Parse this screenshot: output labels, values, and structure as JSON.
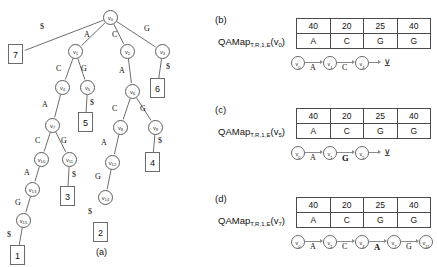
{
  "figure": {
    "caption_a": "(a)",
    "panel_b_label": "(b)",
    "panel_c_label": "(c)",
    "panel_d_label": "(d)"
  },
  "tree": {
    "nodes": [
      {
        "id": "v0",
        "label": "v",
        "sub": "0",
        "x": 103,
        "y": 10
      },
      {
        "id": "v1",
        "label": "v",
        "sub": "1",
        "x": 68,
        "y": 44
      },
      {
        "id": "v2",
        "label": "v",
        "sub": "2",
        "x": 120,
        "y": 44
      },
      {
        "id": "v3",
        "label": "v",
        "sub": "3",
        "x": 155,
        "y": 44
      },
      {
        "id": "v4",
        "label": "v",
        "sub": "4",
        "x": 55,
        "y": 80
      },
      {
        "id": "v5",
        "label": "v",
        "sub": "5",
        "x": 80,
        "y": 80
      },
      {
        "id": "v6",
        "label": "v",
        "sub": "6",
        "x": 125,
        "y": 84
      },
      {
        "id": "v7",
        "label": "v",
        "sub": "7",
        "x": 45,
        "y": 118
      },
      {
        "id": "v8",
        "label": "v",
        "sub": "8",
        "x": 113,
        "y": 120
      },
      {
        "id": "v9",
        "label": "v",
        "sub": "9",
        "x": 148,
        "y": 120
      },
      {
        "id": "v10",
        "label": "v",
        "sub": "10",
        "x": 34,
        "y": 152
      },
      {
        "id": "v11",
        "label": "v",
        "sub": "11",
        "x": 62,
        "y": 152
      },
      {
        "id": "v12",
        "label": "v",
        "sub": "12",
        "x": 105,
        "y": 155
      },
      {
        "id": "v13",
        "label": "v",
        "sub": "13",
        "x": 25,
        "y": 182
      },
      {
        "id": "v14",
        "label": "v",
        "sub": "14",
        "x": 98,
        "y": 190
      },
      {
        "id": "v15",
        "label": "v",
        "sub": "15",
        "x": 16,
        "y": 213
      }
    ],
    "leaves": [
      {
        "id": "leaf7",
        "value": "7",
        "x": 8,
        "y": 44
      },
      {
        "id": "leaf6",
        "value": "6",
        "x": 150,
        "y": 78
      },
      {
        "id": "leaf5",
        "value": "5",
        "x": 78,
        "y": 112
      },
      {
        "id": "leaf4",
        "value": "4",
        "x": 145,
        "y": 152
      },
      {
        "id": "leaf3",
        "value": "3",
        "x": 60,
        "y": 186
      },
      {
        "id": "leaf2",
        "value": "2",
        "x": 93,
        "y": 222
      },
      {
        "id": "leaf1",
        "value": "1",
        "x": 10,
        "y": 245
      }
    ],
    "edges": [
      {
        "from": "v0",
        "to": "leaf7",
        "label": "$",
        "lx": 40,
        "ly": 22
      },
      {
        "from": "v0",
        "to": "v1",
        "label": "A",
        "lx": 84,
        "ly": 30
      },
      {
        "from": "v0",
        "to": "v2",
        "label": "C",
        "lx": 112,
        "ly": 30
      },
      {
        "from": "v0",
        "to": "v3",
        "label": "G",
        "lx": 144,
        "ly": 24
      },
      {
        "from": "v1",
        "to": "v4",
        "label": "C",
        "lx": 56,
        "ly": 64
      },
      {
        "from": "v1",
        "to": "v5",
        "label": "G",
        "lx": 81,
        "ly": 64
      },
      {
        "from": "v2",
        "to": "v6",
        "label": "A",
        "lx": 119,
        "ly": 66
      },
      {
        "from": "v3",
        "to": "leaf6",
        "label": "$",
        "lx": 166,
        "ly": 62
      },
      {
        "from": "v4",
        "to": "v7",
        "label": "A",
        "lx": 42,
        "ly": 100
      },
      {
        "from": "v5",
        "to": "leaf5",
        "label": "$",
        "lx": 90,
        "ly": 98
      },
      {
        "from": "v6",
        "to": "v8",
        "label": "C",
        "lx": 112,
        "ly": 104
      },
      {
        "from": "v6",
        "to": "v9",
        "label": "G",
        "lx": 140,
        "ly": 104
      },
      {
        "from": "v7",
        "to": "v10",
        "label": "C",
        "lx": 35,
        "ly": 136
      },
      {
        "from": "v7",
        "to": "v11",
        "label": "G",
        "lx": 61,
        "ly": 136
      },
      {
        "from": "v8",
        "to": "v12",
        "label": "A",
        "lx": 101,
        "ly": 138
      },
      {
        "from": "v9",
        "to": "leaf4",
        "label": "$",
        "lx": 158,
        "ly": 136
      },
      {
        "from": "v10",
        "to": "v13",
        "label": "A",
        "lx": 24,
        "ly": 168
      },
      {
        "from": "v11",
        "to": "leaf3",
        "label": "$",
        "lx": 72,
        "ly": 170
      },
      {
        "from": "v12",
        "to": "v14",
        "label": "G",
        "lx": 95,
        "ly": 172
      },
      {
        "from": "v13",
        "to": "v15",
        "label": "G",
        "lx": 15,
        "ly": 198
      },
      {
        "from": "v14",
        "to": "leaf1x",
        "label": "$",
        "lx": 88,
        "ly": 207
      },
      {
        "from": "v15",
        "to": "leaf1",
        "label": "$",
        "lx": 7,
        "ly": 230
      }
    ]
  },
  "panels": [
    {
      "key": "b",
      "tag": "(b)",
      "qamap_name": "QAMap",
      "qamap_subscript": "T,R,1,E",
      "qamap_arg_v": "v",
      "qamap_arg_sub": "0",
      "table": {
        "row_values": [
          "40",
          "20",
          "25",
          "40"
        ],
        "row_bases": [
          "A",
          "C",
          "G",
          "G"
        ]
      },
      "path": {
        "nodes": [
          {
            "label": "v",
            "sub": "0"
          },
          {
            "label": "v",
            "sub": "1"
          },
          {
            "label": "v",
            "sub": "4"
          }
        ],
        "edge_labels": [
          {
            "text": "A",
            "bold": false
          },
          {
            "text": "C",
            "bold": false
          }
        ],
        "terminator": "stop"
      }
    },
    {
      "key": "c",
      "tag": "(c)",
      "qamap_name": "QAMap",
      "qamap_subscript": "T,R,1,E",
      "qamap_arg_v": "v",
      "qamap_arg_sub": "5",
      "table": {
        "row_values": [
          "40",
          "20",
          "25",
          "40"
        ],
        "row_bases": [
          "A",
          "C",
          "G",
          "G"
        ]
      },
      "path": {
        "nodes": [
          {
            "label": "v",
            "sub": "0"
          },
          {
            "label": "v",
            "sub": "1"
          },
          {
            "label": "v",
            "sub": "5"
          }
        ],
        "edge_labels": [
          {
            "text": "A",
            "bold": false
          },
          {
            "text": "G",
            "bold": true
          }
        ],
        "terminator": "stop"
      }
    },
    {
      "key": "d",
      "tag": "(d)",
      "qamap_name": "QAMap",
      "qamap_subscript": "T,R,1,E",
      "qamap_arg_v": "v",
      "qamap_arg_sub": "7",
      "table": {
        "row_values": [
          "40",
          "20",
          "25",
          "40"
        ],
        "row_bases": [
          "A",
          "C",
          "G",
          "G"
        ]
      },
      "path": {
        "nodes": [
          {
            "label": "v",
            "sub": "0"
          },
          {
            "label": "v",
            "sub": "1"
          },
          {
            "label": "v",
            "sub": "4"
          },
          {
            "label": "v",
            "sub": "7"
          },
          {
            "label": "v",
            "sub": "11"
          }
        ],
        "edge_labels": [
          {
            "text": "A",
            "bold": false
          },
          {
            "text": "C",
            "bold": false
          },
          {
            "text": "A",
            "bold": true
          },
          {
            "text": "G",
            "bold": false
          }
        ],
        "terminator": "none"
      }
    }
  ],
  "colors": {
    "stroke": "#5c5c5c",
    "text": "#111111",
    "background": "#ffffff"
  }
}
